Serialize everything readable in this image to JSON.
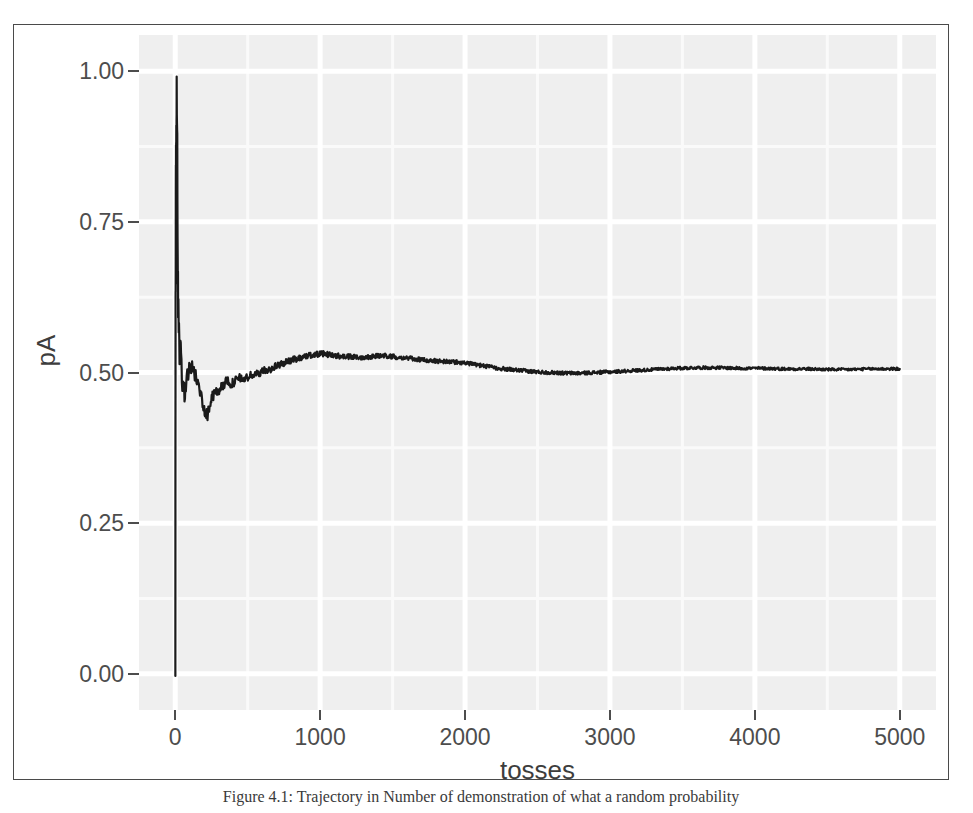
{
  "figure": {
    "caption": "Figure 4.1: Trajectory in Number of demonstration of what a random probability"
  },
  "chart_data": {
    "type": "line",
    "title": "",
    "xlabel": "tosses",
    "ylabel": "pA",
    "xlim": [
      -250,
      5250
    ],
    "ylim": [
      -0.06,
      1.06
    ],
    "xticks": [
      0,
      1000,
      2000,
      3000,
      4000,
      5000
    ],
    "xtick_labels": [
      "0",
      "1000",
      "2000",
      "3000",
      "4000",
      "5000"
    ],
    "yticks": [
      0.0,
      0.25,
      0.5,
      0.75,
      1.0
    ],
    "ytick_labels": [
      "0.00",
      "0.25",
      "0.50",
      "0.75",
      "1.00"
    ],
    "grid": true,
    "grid_major_color": "#ffffff",
    "grid_minor_color": "#fafafa",
    "panel_color": "#efefef",
    "line_color": "#1a1a1a",
    "line_width": 2.2,
    "legend": null,
    "series": [
      {
        "name": "running proportion of heads",
        "x": [
          1,
          2,
          3,
          4,
          5,
          6,
          7,
          8,
          9,
          10,
          12,
          14,
          16,
          18,
          20,
          24,
          28,
          32,
          36,
          40,
          46,
          52,
          58,
          64,
          70,
          80,
          90,
          100,
          110,
          120,
          135,
          150,
          165,
          180,
          200,
          220,
          240,
          260,
          280,
          300,
          330,
          360,
          390,
          420,
          450,
          480,
          520,
          560,
          600,
          650,
          700,
          750,
          800,
          850,
          900,
          960,
          1020,
          1080,
          1140,
          1200,
          1280,
          1360,
          1440,
          1520,
          1600,
          1700,
          1800,
          1900,
          2000,
          2100,
          2200,
          2300,
          2400,
          2500,
          2600,
          2700,
          2800,
          2900,
          3000,
          3150,
          3300,
          3450,
          3600,
          3750,
          3900,
          4050,
          4200,
          4350,
          4500,
          4650,
          4800,
          4900,
          5000
        ],
        "y": [
          0.0,
          0.5,
          0.667,
          0.75,
          0.8,
          0.833,
          0.857,
          0.875,
          0.889,
          1.0,
          0.917,
          0.857,
          0.75,
          0.667,
          0.6,
          0.583,
          0.536,
          0.531,
          0.528,
          0.525,
          0.5,
          0.481,
          0.466,
          0.469,
          0.471,
          0.487,
          0.5,
          0.51,
          0.509,
          0.508,
          0.496,
          0.487,
          0.473,
          0.461,
          0.441,
          0.428,
          0.447,
          0.462,
          0.466,
          0.47,
          0.479,
          0.486,
          0.481,
          0.487,
          0.491,
          0.489,
          0.495,
          0.497,
          0.502,
          0.505,
          0.511,
          0.516,
          0.52,
          0.524,
          0.527,
          0.53,
          0.531,
          0.529,
          0.527,
          0.526,
          0.525,
          0.527,
          0.528,
          0.526,
          0.524,
          0.521,
          0.519,
          0.518,
          0.516,
          0.512,
          0.508,
          0.505,
          0.503,
          0.501,
          0.5,
          0.499,
          0.499,
          0.5,
          0.501,
          0.503,
          0.505,
          0.507,
          0.508,
          0.508,
          0.507,
          0.507,
          0.506,
          0.506,
          0.505,
          0.505,
          0.506,
          0.506,
          0.506
        ]
      }
    ]
  }
}
